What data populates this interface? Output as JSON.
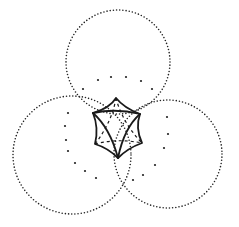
{
  "figure": {
    "colors": {
      "background": "#ffffff",
      "ink": "#1a1a1a"
    },
    "circles": [
      {
        "name": "top",
        "cx": 118,
        "cy": 62,
        "r": 52
      },
      {
        "name": "bottom-left",
        "cx": 72,
        "cy": 155,
        "r": 59
      },
      {
        "name": "bottom-right",
        "cx": 168,
        "cy": 154,
        "r": 54
      }
    ],
    "central_shape": {
      "vertices": {
        "top": [
          116,
          98
        ],
        "upper_left": [
          93,
          113
        ],
        "upper_right": [
          140,
          114
        ],
        "lower_left": [
          95,
          144
        ],
        "lower_right": [
          142,
          143
        ],
        "bottom": [
          118,
          158
        ]
      }
    },
    "inner_dots": [
      [
        98,
        80
      ],
      [
        111,
        77
      ],
      [
        126,
        77
      ],
      [
        141,
        81
      ],
      [
        152,
        89
      ],
      [
        83,
        89
      ],
      [
        68,
        113
      ],
      [
        65,
        126
      ],
      [
        66,
        140
      ],
      [
        68,
        151
      ],
      [
        75,
        163
      ],
      [
        85,
        171
      ],
      [
        96,
        178
      ],
      [
        167,
        117
      ],
      [
        168,
        134
      ],
      [
        164,
        148
      ],
      [
        155,
        165
      ],
      [
        143,
        175
      ],
      [
        133,
        180
      ]
    ]
  }
}
